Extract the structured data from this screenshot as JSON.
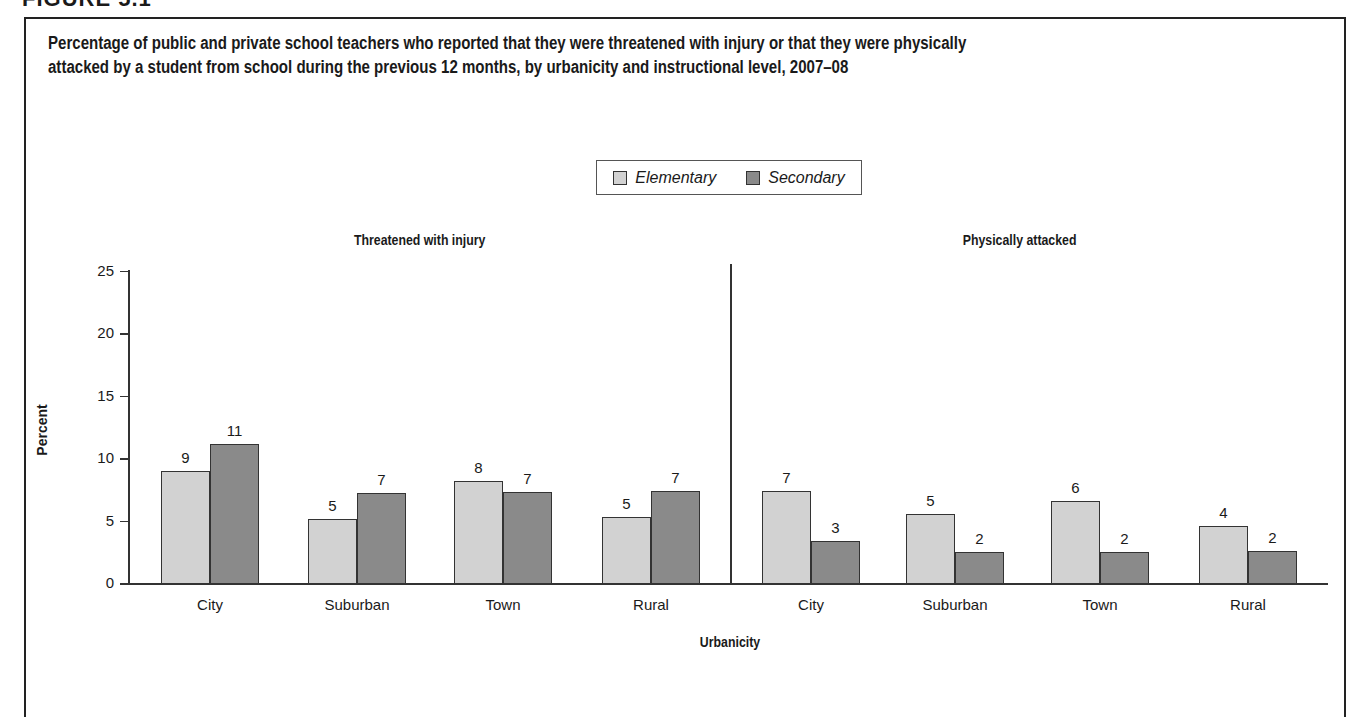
{
  "figure_label": "FIGURE 5.1",
  "title_line1": "Percentage of public and private school teachers who reported that they were threatened with injury or that they were physically",
  "title_line2": "attacked by a student from school during the previous 12 months, by urbanicity and instructional level, 2007–08",
  "legend": {
    "items": [
      {
        "label": "Elementary",
        "color": "#d2d2d2"
      },
      {
        "label": "Secondary",
        "color": "#8a8a8a"
      }
    ]
  },
  "axes": {
    "ylabel": "Percent",
    "xlabel": "Urbanicity",
    "yticks": [
      "0",
      "5",
      "10",
      "15",
      "20",
      "25"
    ]
  },
  "panels": [
    {
      "title": "Threatened with injury",
      "categories": [
        "City",
        "Suburban",
        "Town",
        "Rural"
      ],
      "elementary": [
        9,
        5,
        8,
        5
      ],
      "secondary": [
        11,
        7,
        7,
        7
      ],
      "elementary_heights": [
        9.0,
        5.1,
        8.2,
        5.3
      ],
      "secondary_heights": [
        11.1,
        7.2,
        7.3,
        7.4
      ]
    },
    {
      "title": "Physically attacked",
      "categories": [
        "City",
        "Suburban",
        "Town",
        "Rural"
      ],
      "elementary": [
        7,
        5,
        6,
        4
      ],
      "secondary": [
        3,
        2,
        2,
        2
      ],
      "elementary_heights": [
        7.4,
        5.5,
        6.6,
        4.6
      ],
      "secondary_heights": [
        3.4,
        2.5,
        2.5,
        2.6
      ]
    }
  ],
  "chart_data": {
    "type": "bar",
    "xlabel": "Urbanicity",
    "ylabel": "Percent",
    "ylim": [
      0,
      25
    ],
    "yticks": [
      0,
      5,
      10,
      15,
      20,
      25
    ],
    "grid": false,
    "legend_position": "top-center",
    "legend": [
      "Elementary",
      "Secondary"
    ],
    "panels": [
      {
        "title": "Threatened with injury",
        "categories": [
          "City",
          "Suburban",
          "Town",
          "Rural"
        ],
        "series": [
          {
            "name": "Elementary",
            "values": [
              9,
              5,
              8,
              5
            ]
          },
          {
            "name": "Secondary",
            "values": [
              11,
              7,
              7,
              7
            ]
          }
        ]
      },
      {
        "title": "Physically attacked",
        "categories": [
          "City",
          "Suburban",
          "Town",
          "Rural"
        ],
        "series": [
          {
            "name": "Elementary",
            "values": [
              7,
              5,
              6,
              4
            ]
          },
          {
            "name": "Secondary",
            "values": [
              3,
              2,
              2,
              2
            ]
          }
        ]
      }
    ]
  }
}
